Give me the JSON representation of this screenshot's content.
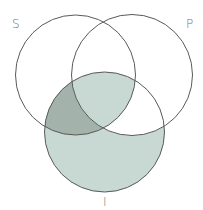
{
  "diagram": {
    "type": "venn-3",
    "circles": [
      {
        "id": "S",
        "label": "S",
        "cx": 75.5,
        "cy": 75,
        "r": 60
      },
      {
        "id": "P",
        "label": "P",
        "cx": 132,
        "cy": 75,
        "r": 60.5
      },
      {
        "id": "I",
        "label": "I",
        "cx": 104.5,
        "cy": 132,
        "r": 60
      }
    ],
    "labels": {
      "s": "S",
      "p": "P",
      "i": "I"
    },
    "shading": {
      "I_only": "light",
      "S_and_I_not_P": "dark",
      "S_and_P_and_I": "light",
      "P_and_I_not_S": "none",
      "S_only": "none",
      "P_only": "none",
      "S_and_P_not_I": "none"
    },
    "colors": {
      "light": "#c8d8d2",
      "dark": "#a3b3ac",
      "stroke": "#5a5a5a",
      "label": "#777777"
    }
  }
}
